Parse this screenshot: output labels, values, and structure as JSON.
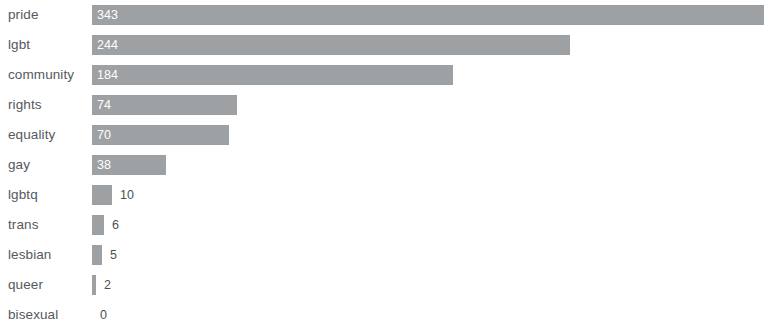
{
  "chart_data": {
    "type": "bar",
    "orientation": "horizontal",
    "title": "",
    "subtitle": "",
    "xlabel": "",
    "ylabel": "",
    "grid": false,
    "legend": null,
    "xlim": [
      0,
      343
    ],
    "axis_visible": false,
    "tick_labels": [],
    "categories": [
      "pride",
      "lgbt",
      "community",
      "rights",
      "equality",
      "gay",
      "lgbtq",
      "trans",
      "lesbian",
      "queer",
      "bisexual"
    ],
    "values": [
      343,
      244,
      184,
      74,
      70,
      38,
      10,
      6,
      5,
      2,
      0
    ],
    "value_labels": [
      "343",
      "244",
      "184",
      "74",
      "70",
      "38",
      "10",
      "6",
      "5",
      "2",
      "0"
    ],
    "label_placement": [
      "inside",
      "inside",
      "inside",
      "inside",
      "inside",
      "inside",
      "outside",
      "outside",
      "outside",
      "outside",
      "outside"
    ],
    "bar_color": "#9da1a3",
    "inside_label_color": "#ffffff",
    "outside_label_color": "#4c5053",
    "category_label_color": "#55595e",
    "background_color": "#ffffff",
    "note": "pride bar is clipped by the right edge of the viewport"
  }
}
